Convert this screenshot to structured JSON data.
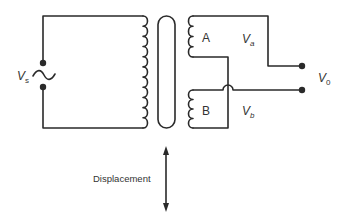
{
  "diagram": {
    "type": "LVDT circuit (linear variable differential transformer)",
    "source_label": "V",
    "source_sub": "s",
    "coil_a_label": "A",
    "coil_b_label": "B",
    "va_label": "V",
    "va_sub": "a",
    "vb_label": "V",
    "vb_sub": "b",
    "output_label": "V",
    "output_sub": "0",
    "displacement_label": "Displacement",
    "colors": {
      "line": "#2a2a2a",
      "text": "#333333",
      "background": "#ffffff"
    }
  }
}
